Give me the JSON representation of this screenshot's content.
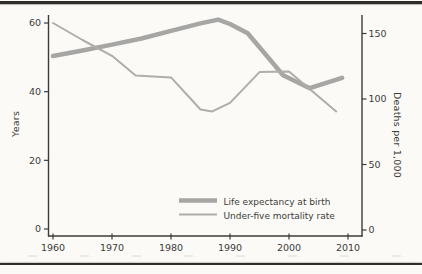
{
  "page": {
    "background_color": "#fbfaf7",
    "rule_color": "#2e2d2b"
  },
  "chart_data": {
    "type": "line",
    "title": "",
    "x_axis": {
      "ticks": [
        1960,
        1970,
        1980,
        1990,
        2000,
        2010
      ],
      "range": [
        1959,
        2012
      ]
    },
    "left_axis": {
      "label": "Years",
      "ticks": [
        0,
        20,
        40,
        60
      ],
      "range": [
        0,
        64
      ]
    },
    "right_axis": {
      "label": "Deaths per 1,000",
      "ticks": [
        0,
        50,
        100,
        150
      ],
      "range": [
        0,
        164
      ]
    },
    "grid": false,
    "legend_position": "inside-bottom-right",
    "style": {
      "axis_color": "#3d3c3a",
      "text_color": "#3c3c3c",
      "thick_line_color": "#a6a6a4",
      "thin_line_color": "#adadab"
    },
    "series": [
      {
        "name": "Life expectancy at birth",
        "axis": "left",
        "line_weight": "thick",
        "color": "#a6a6a4",
        "points": [
          [
            1960,
            50.4
          ],
          [
            1965,
            52
          ],
          [
            1970,
            53.7
          ],
          [
            1975,
            55.5
          ],
          [
            1980,
            57.7
          ],
          [
            1985,
            59.9
          ],
          [
            1988,
            61
          ],
          [
            1990,
            59.7
          ],
          [
            1993,
            57
          ],
          [
            1999,
            44.8
          ],
          [
            2003.5,
            41
          ],
          [
            2009,
            44
          ]
        ]
      },
      {
        "name": "Under-five mortality rate",
        "axis": "right",
        "line_weight": "thin",
        "color": "#adadab",
        "points": [
          [
            1960,
            158
          ],
          [
            1965,
            145
          ],
          [
            1970,
            133
          ],
          [
            1974,
            118
          ],
          [
            1980,
            116.5
          ],
          [
            1985,
            92
          ],
          [
            1987,
            90.5
          ],
          [
            1990,
            97
          ],
          [
            1995,
            120.5
          ],
          [
            2000,
            121
          ],
          [
            2008,
            90.5
          ]
        ]
      }
    ]
  }
}
